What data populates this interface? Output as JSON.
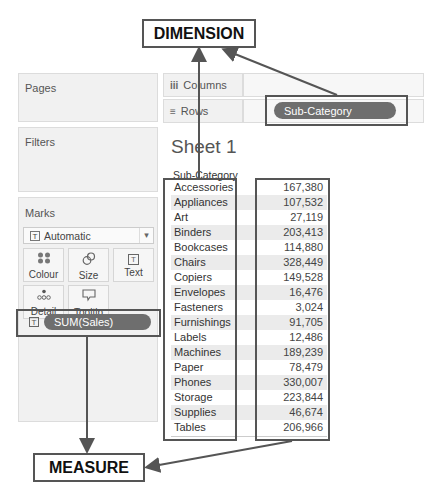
{
  "callouts": {
    "dimension": "DIMENSION",
    "measure": "MEASURE"
  },
  "left_panels": {
    "pages": "Pages",
    "filters": "Filters",
    "marks": "Marks"
  },
  "shelves": {
    "columns": {
      "icon": "iii",
      "label": "Columns"
    },
    "rows": {
      "icon": "≡",
      "label": "Rows",
      "pill": "Sub-Category"
    }
  },
  "marks": {
    "type_icon": "T",
    "type": "Automatic",
    "dropdown_icon": "▾",
    "buttons": [
      {
        "name": "colour",
        "icon": "●●",
        "label": "Colour"
      },
      {
        "name": "size",
        "icon": "◌",
        "label": "Size"
      },
      {
        "name": "text",
        "icon": "T",
        "label": "Text"
      },
      {
        "name": "detail",
        "icon": "∴",
        "label": "Detail"
      },
      {
        "name": "tooltip",
        "icon": "▭",
        "label": "Tooltip"
      }
    ],
    "measure_pill_icon": "T",
    "measure_pill": "SUM(Sales)"
  },
  "sheet": {
    "title": "Sheet 1",
    "column_header": "Sub-Category",
    "rows": [
      {
        "name": "Accessories",
        "value": "167,380"
      },
      {
        "name": "Appliances",
        "value": "107,532"
      },
      {
        "name": "Art",
        "value": "27,119"
      },
      {
        "name": "Binders",
        "value": "203,413"
      },
      {
        "name": "Bookcases",
        "value": "114,880"
      },
      {
        "name": "Chairs",
        "value": "328,449"
      },
      {
        "name": "Copiers",
        "value": "149,528"
      },
      {
        "name": "Envelopes",
        "value": "16,476"
      },
      {
        "name": "Fasteners",
        "value": "3,024"
      },
      {
        "name": "Furnishings",
        "value": "91,705"
      },
      {
        "name": "Labels",
        "value": "12,486"
      },
      {
        "name": "Machines",
        "value": "189,239"
      },
      {
        "name": "Paper",
        "value": "78,479"
      },
      {
        "name": "Phones",
        "value": "330,007"
      },
      {
        "name": "Storage",
        "value": "223,844"
      },
      {
        "name": "Supplies",
        "value": "46,674"
      },
      {
        "name": "Tables",
        "value": "206,966"
      }
    ]
  },
  "colors": {
    "pill": "#6e6e6e",
    "panel": "#f1f1f1",
    "highlight_border": "#555555"
  }
}
